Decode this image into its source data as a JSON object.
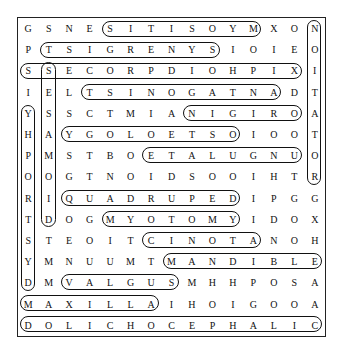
{
  "puzzle": {
    "rows": 15,
    "cols": 15,
    "grid": [
      "GSNESITISOYMXON",
      "PTSIGRENYSIOIEO",
      "SSECORPDIOHPIXI",
      "IELTSINOGATNADT",
      "YSSCTMIANIGIROA",
      "HAYGOLOETSOIOOT",
      "PMSTBOETALUGNUO",
      "OOGTNOIDSOOIHTR",
      "RIQUADRUPEDIPGG",
      "TDOGMYOTOMYIDOX",
      "STEOITCINOTANOH",
      "YMNUUMTMANDIBLE",
      "DMVALGUSMHHPOSA",
      "MAXILLAIHOIGOOA",
      "DOLICHOCEPHALIC"
    ],
    "found_words": [
      {
        "word": "MYOSITIS",
        "row": 1,
        "col_start": 5,
        "col_end": 12,
        "direction": "horizontal-reversed"
      },
      {
        "word": "SYNERGIST",
        "row": 2,
        "col_start": 2,
        "col_end": 10,
        "direction": "horizontal-reversed"
      },
      {
        "word": "XIPHOIDPROCESS",
        "row": 3,
        "col_start": 1,
        "col_end": 14,
        "direction": "horizontal-reversed"
      },
      {
        "word": "ANTAGONIST",
        "row": 4,
        "col_start": 4,
        "col_end": 13,
        "direction": "horizontal-reversed"
      },
      {
        "word": "ORIGIN",
        "row": 5,
        "col_start": 9,
        "col_end": 14,
        "direction": "horizontal-reversed"
      },
      {
        "word": "OSTEOLOGY",
        "row": 6,
        "col_start": 3,
        "col_end": 11,
        "direction": "horizontal-reversed"
      },
      {
        "word": "UNGULATE",
        "row": 7,
        "col_start": 7,
        "col_end": 14,
        "direction": "horizontal-reversed"
      },
      {
        "word": "QUADRUPED",
        "row": 9,
        "col_start": 3,
        "col_end": 11,
        "direction": "horizontal"
      },
      {
        "word": "MYOTOMY",
        "row": 10,
        "col_start": 5,
        "col_end": 11,
        "direction": "horizontal"
      },
      {
        "word": "ATONIC",
        "row": 11,
        "col_start": 7,
        "col_end": 12,
        "direction": "horizontal-reversed"
      },
      {
        "word": "MANDIBLE",
        "row": 12,
        "col_start": 8,
        "col_end": 15,
        "direction": "horizontal"
      },
      {
        "word": "VALGUS",
        "row": 13,
        "col_start": 3,
        "col_end": 8,
        "direction": "horizontal"
      },
      {
        "word": "MAXILLA",
        "row": 14,
        "col_start": 1,
        "col_end": 7,
        "direction": "horizontal"
      },
      {
        "word": "DOLICHOCEPHALIC",
        "row": 15,
        "col_start": 1,
        "col_end": 15,
        "direction": "horizontal"
      },
      {
        "word": "DYSTROPHY",
        "col": 1,
        "row_start": 5,
        "row_end": 13,
        "direction": "vertical-reversed"
      },
      {
        "word": "SESAMOID",
        "col": 2,
        "row_start": 3,
        "row_end": 10,
        "direction": "vertical"
      },
      {
        "word": "ROTATION",
        "col": 15,
        "row_start": 1,
        "row_end": 8,
        "direction": "vertical-reversed"
      }
    ]
  },
  "colors": {
    "background": "#ffffff",
    "ink": "#111111",
    "border": "#222222"
  }
}
